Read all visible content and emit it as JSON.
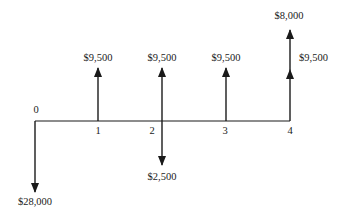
{
  "diagram": {
    "type": "cash-flow-diagram",
    "periods": [
      "0",
      "1",
      "2",
      "3",
      "4"
    ],
    "cash_flows": [
      {
        "period": "0",
        "direction": "down",
        "label": "$28,000"
      },
      {
        "period": "1",
        "direction": "up",
        "label": "$9,500"
      },
      {
        "period": "2",
        "direction": "up",
        "label": "$9,500"
      },
      {
        "period": "2",
        "direction": "down",
        "label": "$2,500"
      },
      {
        "period": "3",
        "direction": "up",
        "label": "$9,500"
      },
      {
        "period": "4",
        "direction": "up",
        "label": "$9,500"
      },
      {
        "period": "4",
        "direction": "up",
        "label": "$8,000"
      }
    ],
    "colors": {
      "line": "#1a1a1a",
      "background": "#ffffff"
    }
  }
}
